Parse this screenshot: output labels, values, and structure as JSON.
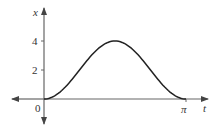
{
  "chart_data": {
    "type": "line",
    "title": "",
    "xlabel": "t",
    "ylabel": "x",
    "origin_label": "0",
    "x_ticks": [
      {
        "value": 3.14159,
        "label": "π"
      }
    ],
    "y_ticks": [
      {
        "value": 2,
        "label": "2"
      },
      {
        "value": 4,
        "label": "4"
      }
    ],
    "xlim": [
      0,
      3.14159
    ],
    "ylim": [
      0,
      4
    ],
    "grid": false,
    "legend": null,
    "series": [
      {
        "name": "x(t)",
        "description": "smooth bump rising from 0 at t=0 to maximum 4 at t=π/2 and back to 0 at t=π (x = 4 sin² t)",
        "x": [
          0,
          0.3927,
          0.7854,
          1.1781,
          1.5708,
          1.9635,
          2.3562,
          2.7489,
          3.14159
        ],
        "y": [
          0,
          0.586,
          2.0,
          3.414,
          4.0,
          3.414,
          2.0,
          0.586,
          0
        ]
      }
    ],
    "colors": {
      "axis": "#555555",
      "curve": "#222222",
      "text": "#333333"
    }
  }
}
